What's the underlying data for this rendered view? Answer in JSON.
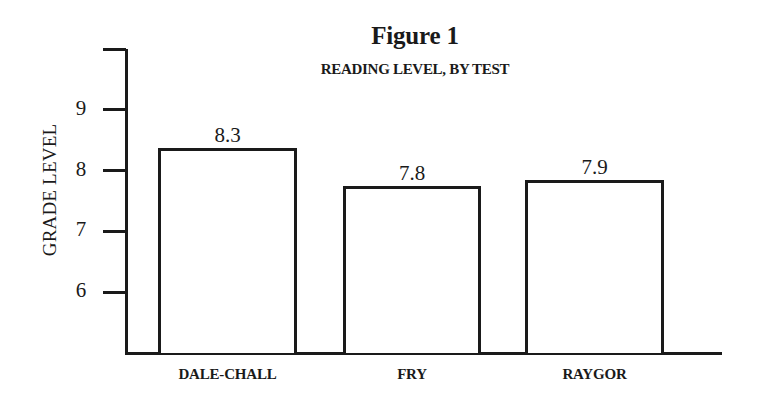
{
  "chart_data": {
    "type": "bar",
    "title": "Figure 1",
    "subtitle": "READING LEVEL, BY TEST",
    "xlabel": "",
    "ylabel": "GRADE LEVEL",
    "categories": [
      "DALE-CHALL",
      "FRY",
      "RAYGOR"
    ],
    "values": [
      8.3,
      7.8,
      7.9
    ],
    "value_labels": [
      "8.3",
      "7.8",
      "7.9"
    ],
    "ylim": [
      5,
      10
    ],
    "yticks": [
      6,
      7,
      8,
      9,
      10
    ],
    "ytick_labels": [
      "6",
      "7",
      "8",
      "9",
      ""
    ],
    "grid": false,
    "legend": null,
    "bar_fill": "#ffffff",
    "bar_edge": "#1a1a1a"
  }
}
